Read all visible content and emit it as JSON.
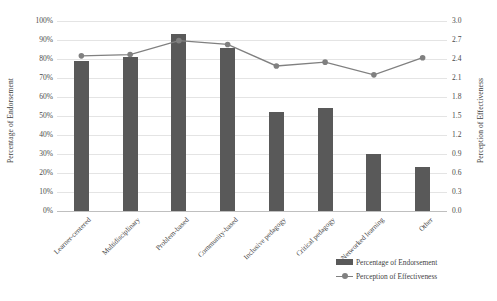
{
  "chart_data": {
    "type": "bar",
    "title": "",
    "xlabel": "",
    "ylabel": "Percentage of Endorsement",
    "y2label": "Perception of Effectiveness",
    "grid": true,
    "legend_position": "bottom-right",
    "categories": [
      "Learner-centered",
      "Multidisciplinary",
      "Problem-based",
      "Community-based",
      "Inclusive pedagogy",
      "Critical pedagogy",
      "Networked learning",
      "Other"
    ],
    "series": [
      {
        "name": "Percentage of Endorsement",
        "type": "bar",
        "axis": "left",
        "color": "#595959",
        "values": [
          79,
          81,
          93,
          86,
          52,
          54,
          30,
          23
        ]
      },
      {
        "name": "Perception of Effectiveness",
        "type": "line",
        "axis": "right",
        "color": "#808080",
        "values": [
          2.45,
          2.47,
          2.69,
          2.63,
          2.29,
          2.35,
          2.15,
          2.42
        ]
      }
    ],
    "ylim": [
      0,
      100
    ],
    "y2lim": [
      0.0,
      3.0
    ],
    "yticks": [
      "0%",
      "10%",
      "20%",
      "30%",
      "40%",
      "50%",
      "60%",
      "70%",
      "80%",
      "90%",
      "100%"
    ],
    "y2ticks": [
      "0.0",
      "0.3",
      "0.6",
      "0.9",
      "1.2",
      "1.5",
      "1.8",
      "2.1",
      "2.4",
      "2.7",
      "3.0"
    ]
  },
  "legend": {
    "items": [
      {
        "label": "Percentage of Endorsement",
        "marker": "bar-swatch"
      },
      {
        "label": "Perception of Effectiveness",
        "marker": "line-marker-swatch"
      }
    ]
  }
}
